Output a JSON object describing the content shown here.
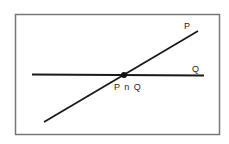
{
  "diagram": {
    "type": "set-intersection-lines",
    "frame": {
      "x": 15,
      "y": 14,
      "width": 205,
      "height": 121,
      "stroke": "#777777"
    },
    "lines": [
      {
        "id": "P",
        "label": "P",
        "x1": 44,
        "y1": 122,
        "x2": 198,
        "y2": 31,
        "label_x": 185,
        "label_y": 28
      },
      {
        "id": "Q",
        "label": "Q",
        "x1": 32,
        "y1": 74,
        "x2": 204,
        "y2": 76,
        "label_x": 193,
        "label_y": 71
      }
    ],
    "intersection": {
      "label": "P∩Q",
      "display_label": "P n Q",
      "x": 124,
      "y": 75,
      "label_x": 115,
      "label_y": 89
    }
  }
}
